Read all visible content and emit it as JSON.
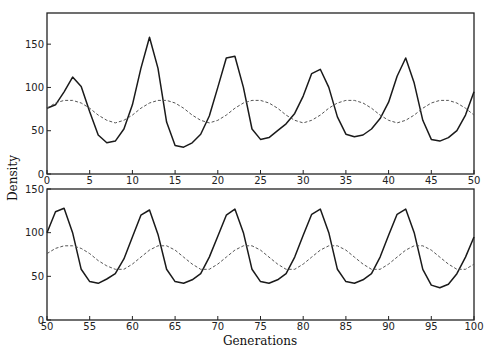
{
  "chart_data": {
    "type": "line",
    "title": "",
    "ylabel": "Density",
    "xlabel": "Generations",
    "grid": false,
    "legend": null,
    "panels": [
      {
        "name": "top",
        "xlim": [
          0,
          50
        ],
        "ylim": [
          0,
          186
        ],
        "xticks": [
          0,
          5,
          10,
          15,
          20,
          25,
          30,
          35,
          40,
          45,
          50
        ],
        "yticks": [
          0,
          50,
          100,
          150
        ],
        "series": [
          {
            "name": "simulated density",
            "style": "solid",
            "x": [
              0,
              1,
              2,
              3,
              4,
              5,
              6,
              7,
              8,
              9,
              10,
              11,
              12,
              13,
              14,
              15,
              16,
              17,
              18,
              19,
              20,
              21,
              22,
              23,
              24,
              25,
              26,
              27,
              28,
              29,
              30,
              31,
              32,
              33,
              34,
              35,
              36,
              37,
              38,
              39,
              40,
              41,
              42,
              43,
              44,
              45,
              46,
              47,
              48,
              49,
              50
            ],
            "values": [
              76,
              80,
              95,
              112,
              101,
              72,
              45,
              36,
              38,
              52,
              80,
              122,
              158,
              122,
              60,
              33,
              31,
              36,
              46,
              67,
              100,
              134,
              136,
              100,
              52,
              40,
              42,
              50,
              58,
              70,
              90,
              116,
              121,
              100,
              66,
              46,
              43,
              45,
              52,
              64,
              83,
              113,
              134,
              105,
              62,
              40,
              38,
              42,
              50,
              68,
              95
            ]
          },
          {
            "name": "periodic reference",
            "style": "dashed",
            "x": [
              0,
              1,
              2,
              3,
              4,
              5,
              6,
              7,
              8,
              9,
              10,
              11,
              12,
              13,
              14,
              15,
              16,
              17,
              18,
              19,
              20,
              21,
              22,
              23,
              24,
              25,
              26,
              27,
              28,
              29,
              30,
              31,
              32,
              33,
              34,
              35,
              36,
              37,
              38,
              39,
              40,
              41,
              42,
              43,
              44,
              45,
              46,
              47,
              48,
              49,
              50
            ],
            "values": [
              76,
              82,
              85,
              85,
              82,
              76,
              68,
              62,
              59,
              62,
              68,
              76,
              82,
              85,
              85,
              82,
              76,
              68,
              62,
              59,
              62,
              68,
              76,
              82,
              85,
              85,
              82,
              76,
              68,
              62,
              59,
              62,
              68,
              76,
              82,
              85,
              85,
              82,
              76,
              68,
              62,
              59,
              62,
              68,
              76,
              82,
              85,
              85,
              82,
              76,
              68
            ]
          }
        ]
      },
      {
        "name": "bottom",
        "xlim": [
          50,
          100
        ],
        "ylim": [
          0,
          150
        ],
        "xticks": [
          50,
          55,
          60,
          65,
          70,
          75,
          80,
          85,
          90,
          95,
          100
        ],
        "yticks": [
          0,
          50,
          100,
          150
        ],
        "series": [
          {
            "name": "simulated density",
            "style": "solid",
            "x": [
              50,
              51,
              52,
              53,
              54,
              55,
              56,
              57,
              58,
              59,
              60,
              61,
              62,
              63,
              64,
              65,
              66,
              67,
              68,
              69,
              70,
              71,
              72,
              73,
              74,
              75,
              76,
              77,
              78,
              79,
              80,
              81,
              82,
              83,
              84,
              85,
              86,
              87,
              88,
              89,
              90,
              91,
              92,
              93,
              94,
              95,
              96,
              97,
              98,
              99,
              100
            ],
            "values": [
              100,
              124,
              128,
              100,
              58,
              44,
              42,
              47,
              53,
              70,
              95,
              120,
              126,
              98,
              58,
              44,
              42,
              46,
              53,
              72,
              96,
              120,
              127,
              100,
              58,
              44,
              42,
              46,
              53,
              72,
              97,
              121,
              127,
              100,
              58,
              44,
              42,
              46,
              53,
              72,
              97,
              121,
              127,
              100,
              58,
              40,
              37,
              41,
              53,
              72,
              95
            ]
          },
          {
            "name": "periodic reference",
            "style": "dashed",
            "x": [
              50,
              51,
              52,
              53,
              54,
              55,
              56,
              57,
              58,
              59,
              60,
              61,
              62,
              63,
              64,
              65,
              66,
              67,
              68,
              69,
              70,
              71,
              72,
              73,
              74,
              75,
              76,
              77,
              78,
              79,
              80,
              81,
              82,
              83,
              84,
              85,
              86,
              87,
              88,
              89,
              90,
              91,
              92,
              93,
              94,
              95,
              96,
              97,
              98,
              99,
              100
            ],
            "values": [
              76,
              82,
              85,
              85,
              82,
              76,
              68,
              62,
              58,
              58,
              64,
              72,
              80,
              85,
              85,
              80,
              72,
              64,
              58,
              58,
              64,
              72,
              80,
              85,
              85,
              80,
              72,
              64,
              58,
              58,
              64,
              72,
              80,
              85,
              85,
              80,
              72,
              64,
              58,
              58,
              64,
              72,
              80,
              85,
              85,
              80,
              72,
              64,
              58,
              58,
              64
            ]
          }
        ]
      }
    ]
  },
  "labels": {
    "ylabel": "Density",
    "xlabel": "Generations"
  },
  "colors": {
    "solid_line": "#1a1a1a",
    "dashed_line": "#555555",
    "axis": "#222222"
  }
}
